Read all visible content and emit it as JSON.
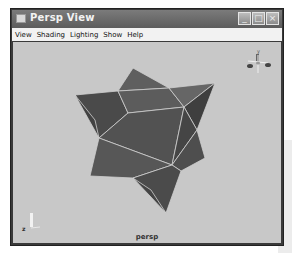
{
  "window": {
    "title": "Persp View",
    "controls": [
      "minimize",
      "maximize",
      "close"
    ]
  },
  "menubar": {
    "items": [
      {
        "label": "View"
      },
      {
        "label": "Shading"
      },
      {
        "label": "Lighting"
      },
      {
        "label": "Show"
      },
      {
        "label": "Help"
      }
    ]
  },
  "viewport": {
    "camera_label": "persp",
    "object": "stellated octahedron (wireframe on shaded)",
    "view_cube_label": "y",
    "axis_label": "z",
    "colors": {
      "background": "#c8c8c8",
      "face_dark": "#4a4a4a",
      "face_mid": "#5a5a5a",
      "face_light": "#6a6a6a",
      "edge": "#d0d0d0"
    }
  }
}
